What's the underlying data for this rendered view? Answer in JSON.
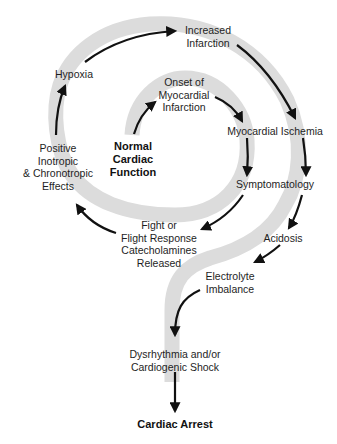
{
  "diagram": {
    "colors": {
      "band": "#dcdcdc",
      "arrow": "#111111",
      "text": "#1e1e1e"
    },
    "nodes": {
      "start": {
        "lines": [
          "Normal",
          "Cardiac",
          "Function"
        ],
        "bold": true
      },
      "onset": {
        "lines": [
          "Onset of",
          "Myocardial",
          "Infarction"
        ]
      },
      "ischemia": {
        "lines": [
          "Myocardial Ischemia"
        ]
      },
      "symptoms": {
        "lines": [
          "Symptomatology"
        ]
      },
      "fight": {
        "lines": [
          "Fight or",
          "Flight Response",
          "Catecholamines",
          "Released"
        ]
      },
      "inotropic": {
        "lines": [
          "Positive",
          "Inotropic",
          "& Chronotropic",
          "Effects"
        ]
      },
      "hypoxia": {
        "lines": [
          "Hypoxia"
        ]
      },
      "increased": {
        "lines": [
          "Increased",
          "Infarction"
        ]
      },
      "acidosis": {
        "lines": [
          "Acidosis"
        ]
      },
      "electrolyte": {
        "lines": [
          "Electrolyte",
          "Imbalance"
        ]
      },
      "dysrhythmia": {
        "lines": [
          "Dysrhythmia and/or",
          "Cardiogenic Shock"
        ]
      },
      "end": {
        "lines": [
          "Cardiac Arrest"
        ],
        "bold": true
      }
    },
    "flow": [
      "start",
      "onset",
      "ischemia",
      "symptoms",
      "fight",
      "inotropic",
      "hypoxia",
      "increased",
      "ischemia-outer",
      "symptoms-outer",
      "acidosis",
      "electrolyte",
      "dysrhythmia",
      "end"
    ]
  }
}
